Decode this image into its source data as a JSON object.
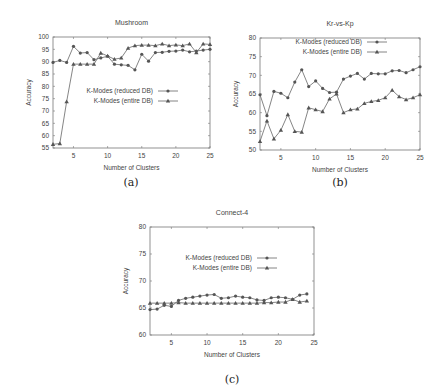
{
  "figure": {
    "captions": [
      "(a)",
      "(b)",
      "(c)"
    ]
  },
  "chart_data": [
    {
      "type": "line",
      "title": "Mushroom",
      "xlabel": "Number of Clusters",
      "ylabel": "Accuracy",
      "xlim": [
        2,
        25
      ],
      "ylim": [
        55,
        100
      ],
      "xticks": [
        5,
        10,
        15,
        20,
        25
      ],
      "yticks": [
        55,
        60,
        65,
        70,
        75,
        80,
        85,
        90,
        95,
        100
      ],
      "grid": false,
      "legend_position": "center",
      "x": [
        2,
        3,
        4,
        5,
        6,
        7,
        8,
        9,
        10,
        11,
        12,
        13,
        14,
        15,
        16,
        17,
        18,
        19,
        20,
        21,
        22,
        23,
        24,
        25
      ],
      "series": [
        {
          "name": "K-Modes (reduced DB)",
          "marker": "circle",
          "values": [
            89.7,
            90.5,
            89.7,
            96.2,
            93.5,
            93.7,
            90.8,
            91.5,
            92.2,
            89.0,
            88.7,
            88.5,
            86.7,
            93.0,
            90.2,
            93.7,
            93.8,
            94.2,
            94.3,
            94.7,
            94.0,
            94.3,
            94.7,
            95.0
          ]
        },
        {
          "name": "K-Modes (entire DB)",
          "marker": "triangle",
          "values": [
            56.5,
            56.8,
            73.8,
            89.0,
            89.0,
            89.0,
            89.0,
            93.5,
            92.3,
            91.0,
            91.5,
            95.5,
            96.5,
            96.7,
            96.7,
            96.5,
            97.2,
            96.5,
            96.8,
            96.5,
            97.2,
            93.7,
            97.2,
            97.0
          ]
        }
      ]
    },
    {
      "type": "line",
      "title": "Kr-vs-Kp",
      "xlabel": "Number of Clusters",
      "ylabel": "Accuracy",
      "xlim": [
        2,
        25
      ],
      "ylim": [
        50,
        80
      ],
      "xticks": [
        5,
        10,
        15,
        20,
        25
      ],
      "yticks": [
        50,
        55,
        60,
        65,
        70,
        75,
        80
      ],
      "grid": false,
      "legend_position": "top-right",
      "x": [
        2,
        3,
        4,
        5,
        6,
        7,
        8,
        9,
        10,
        11,
        12,
        13,
        14,
        15,
        16,
        17,
        18,
        19,
        20,
        21,
        22,
        23,
        24,
        25
      ],
      "series": [
        {
          "name": "K-Modes (reduced DB)",
          "marker": "circle",
          "values": [
            64.8,
            59.2,
            65.7,
            65.2,
            64.0,
            68.2,
            71.5,
            67.0,
            68.5,
            66.5,
            65.4,
            65.5,
            69.0,
            69.8,
            70.5,
            69.0,
            70.5,
            70.4,
            70.4,
            71.2,
            71.3,
            70.7,
            71.5,
            72.3
          ]
        },
        {
          "name": "K-Modes (entire DB)",
          "marker": "triangle",
          "values": [
            52.3,
            57.8,
            53.0,
            55.3,
            59.5,
            55.0,
            54.8,
            61.3,
            60.8,
            60.3,
            63.7,
            65.0,
            60.0,
            60.8,
            61.0,
            62.5,
            63.0,
            63.3,
            64.0,
            66.0,
            64.3,
            63.5,
            64.0,
            64.8
          ]
        }
      ]
    },
    {
      "type": "line",
      "title": "Connect-4",
      "xlabel": "Number of Clusters",
      "ylabel": "Accuracy",
      "xlim": [
        2,
        25
      ],
      "ylim": [
        60,
        80
      ],
      "xticks": [
        5,
        10,
        15,
        20,
        25
      ],
      "yticks": [
        60,
        65,
        70,
        75,
        80
      ],
      "grid": false,
      "legend_position": "upper-center",
      "x": [
        2,
        3,
        4,
        5,
        6,
        7,
        8,
        9,
        10,
        11,
        12,
        13,
        14,
        15,
        16,
        17,
        18,
        19,
        20,
        21,
        22,
        23,
        24
      ],
      "series": [
        {
          "name": "K-Modes (reduced DB)",
          "marker": "circle",
          "values": [
            64.7,
            64.8,
            65.5,
            65.3,
            66.4,
            66.8,
            67.0,
            67.2,
            67.4,
            67.5,
            66.8,
            66.9,
            67.2,
            67.0,
            66.9,
            66.5,
            66.4,
            66.9,
            67.0,
            66.9,
            66.6,
            67.4,
            67.6
          ]
        },
        {
          "name": "K-Modes (entire DB)",
          "marker": "triangle",
          "values": [
            65.9,
            65.9,
            65.9,
            65.9,
            66.0,
            65.9,
            65.9,
            65.9,
            65.9,
            65.9,
            65.9,
            65.9,
            65.9,
            65.9,
            65.9,
            65.9,
            66.0,
            66.0,
            66.1,
            66.1,
            66.6,
            66.1,
            66.3
          ]
        }
      ]
    }
  ]
}
